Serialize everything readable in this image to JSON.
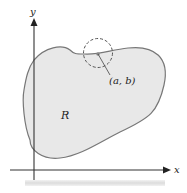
{
  "diagram": {
    "labels": {
      "y_axis": "y",
      "x_axis": "x",
      "region": "R",
      "point": "(a, b)"
    },
    "colors": {
      "region_fill": "#e8e8e8",
      "region_stroke": "#777777",
      "axis": "#333333",
      "circle": "#555555",
      "point": "#888888"
    }
  }
}
